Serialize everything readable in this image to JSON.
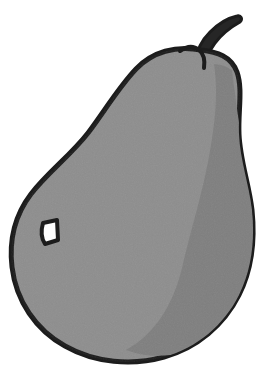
{
  "document": {
    "kind": "illustration",
    "subject": "pear",
    "style": "flat clipart line drawing, grayscale",
    "width": 277,
    "height": 383,
    "background_color": "#ffffff"
  },
  "palette": {
    "background": "#ffffff",
    "outline": "#1c1c1c",
    "body_fill": "#8e8e8e",
    "body_shadow": "#7f7f7f",
    "stem_fill": "#262626",
    "hole_fill": "#fdfdfd",
    "noise_opacity": 0.18
  },
  "shapes": {
    "body": {
      "name": "pear-body",
      "label": "Pear body",
      "fill": "#8e8e8e",
      "stroke": "#1c1c1c",
      "stroke_width": 5,
      "path": "M 201 50 C 176 45 152 52 136 69 C 118 88 104 112 88 133 C 70 156 48 172 31 194 C 15 215 9 241 12 267 C 16 301 36 330 65 346 C 95 363 132 366 164 357 C 197 348 224 325 239 295 C 252 269 255 239 252 210 C 249 184 240 160 239 134 C 238 111 243 89 237 72 C 231 56 217 52 201 50 Z"
    },
    "shadow_crescent": {
      "name": "pear-shading",
      "label": "Interior shading",
      "fill": "#7f7f7f",
      "path": "M 214 64 C 219 96 214 130 208 162 C 201 198 190 233 182 268 C 173 305 155 334 126 350 C 152 360 183 357 208 342 C 233 326 248 299 252 270 C 257 235 252 200 246 166 C 240 131 235 96 232 70 C 226 66 220 64 214 64 Z"
    },
    "stem": {
      "name": "pear-stem",
      "label": "Stem",
      "fill": "#262626",
      "stroke": "#1c1c1c",
      "stroke_width": 3,
      "path": "M 196 60 C 197 50 202 40 210 32 C 218 24 228 18 237 16 C 241 15 243 19 240 22 C 231 27 222 34 215 43 C 209 51 206 60 205 68 C 203 73 196 70 196 60 Z"
    },
    "stem_dimple": {
      "name": "stem-socket",
      "label": "Stem socket line",
      "stroke": "#1c1c1c",
      "stroke_width": 4,
      "path": "M 180 51 C 187 46 194 46 199 50 C 204 54 205 61 204 68"
    },
    "hole": {
      "name": "pear-hole",
      "label": "Blemish hole",
      "fill": "#fdfdfd",
      "stroke": "#1c1c1c",
      "stroke_width": 4,
      "path": "M 43 223 L 57 220 L 58 240 L 45 244 C 41 238 41 230 43 223 Z"
    }
  },
  "annotations": {
    "title": "Pear",
    "caption": "Grayscale clipart pear with stem and small blemish"
  }
}
